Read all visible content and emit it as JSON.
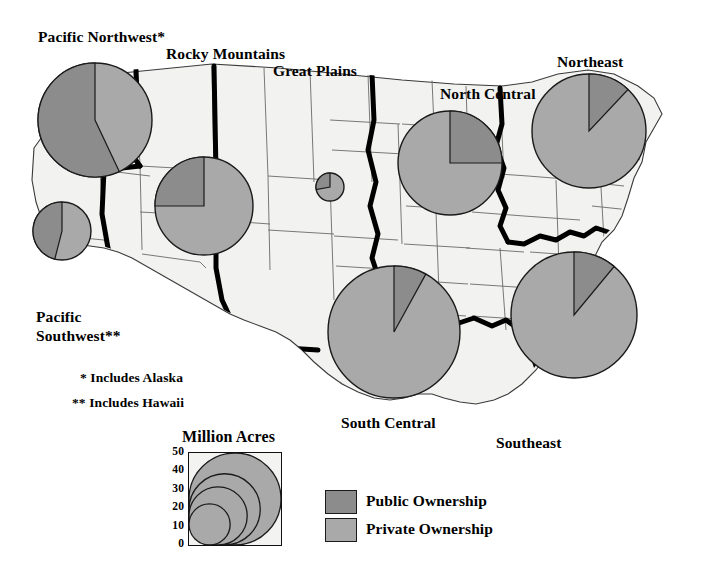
{
  "figure": {
    "type": "choropleth-pie-map",
    "background_color": "#ffffff",
    "map_fill": "#f2f2f0",
    "state_line_color": "#5a5a5a",
    "region_border_color": "#000000"
  },
  "colors": {
    "public": "#8c8c8c",
    "private": "#a9a9a9",
    "outline": "#1a1a1a",
    "text": "#000000"
  },
  "region_labels": [
    {
      "key": "pacific-northwest",
      "label": "Pacific Northwest*",
      "x": 38,
      "y": 28
    },
    {
      "key": "rocky-mountains",
      "label": "Rocky Mountains",
      "x": 166,
      "y": 45
    },
    {
      "key": "great-plains",
      "label": "Great Plains",
      "x": 273,
      "y": 62
    },
    {
      "key": "north-central",
      "label": "North Central",
      "x": 440,
      "y": 85
    },
    {
      "key": "northeast",
      "label": "Northeast",
      "x": 557,
      "y": 53
    },
    {
      "key": "pacific-southwest",
      "label": "Pacific Southwest**",
      "x": 36,
      "y": 307
    },
    {
      "key": "south-central",
      "label": "South Central",
      "x": 341,
      "y": 414
    },
    {
      "key": "southeast",
      "label": "Southeast",
      "x": 496,
      "y": 434
    }
  ],
  "footnotes": [
    {
      "key": "alaska",
      "text": "* Includes Alaska",
      "x": 80,
      "y": 370
    },
    {
      "key": "hawaii",
      "text": "** Includes Hawaii",
      "x": 72,
      "y": 395
    }
  ],
  "chart_data": {
    "type": "pie",
    "units": "Million Acres",
    "legend": [
      "Public Ownership",
      "Private Ownership"
    ],
    "legend_position": "bottom-right",
    "size_encoding": "circle area proportional to million acres",
    "scale_ticks": [
      0,
      10,
      20,
      30,
      40,
      50
    ],
    "scale_circles": [
      10,
      20,
      30,
      50
    ],
    "pies": [
      {
        "region": "Pacific Northwest*",
        "cx": 95,
        "cy": 120,
        "r": 57,
        "public_pct": 57,
        "private_pct": 43,
        "million_acres": 49,
        "start_angle": 0,
        "direction": "counterclockwise"
      },
      {
        "region": "Rocky Mountains",
        "cx": 204,
        "cy": 206,
        "r": 49,
        "public_pct": 25,
        "private_pct": 75,
        "million_acres": 37,
        "start_angle": 0,
        "direction": "counterclockwise"
      },
      {
        "region": "Great Plains",
        "cx": 330,
        "cy": 187,
        "r": 14,
        "public_pct": 28,
        "private_pct": 72,
        "million_acres": 3,
        "start_angle": 0,
        "direction": "counterclockwise"
      },
      {
        "region": "North Central",
        "cx": 450,
        "cy": 163,
        "r": 52,
        "public_pct": 25,
        "private_pct": 75,
        "million_acres": 40,
        "start_angle": 0,
        "direction": "clockwise"
      },
      {
        "region": "Northeast",
        "cx": 589,
        "cy": 131,
        "r": 57,
        "public_pct": 12,
        "private_pct": 88,
        "million_acres": 49,
        "start_angle": 0,
        "direction": "clockwise"
      },
      {
        "region": "Pacific Southwest**",
        "cx": 62,
        "cy": 231,
        "r": 29,
        "public_pct": 46,
        "private_pct": 54,
        "million_acres": 13,
        "start_angle": 0,
        "direction": "counterclockwise"
      },
      {
        "region": "South Central",
        "cx": 394,
        "cy": 332,
        "r": 66,
        "public_pct": 8,
        "private_pct": 92,
        "million_acres": 66,
        "start_angle": 0,
        "direction": "clockwise"
      },
      {
        "region": "Southeast",
        "cx": 574,
        "cy": 315,
        "r": 63,
        "public_pct": 11,
        "private_pct": 89,
        "million_acres": 60,
        "start_angle": 0,
        "direction": "clockwise"
      }
    ]
  },
  "legend": {
    "scale_title": "Million Acres",
    "scale_title_x": 182,
    "scale_title_y": 428,
    "box": {
      "x": 188,
      "y": 452,
      "w": 92,
      "h": 92
    },
    "axis_labels": [
      "50",
      "40",
      "30",
      "20",
      "10",
      "0"
    ],
    "swatches": [
      {
        "key": "public",
        "label": "Public Ownership",
        "color": "#8c8c8c",
        "x": 325,
        "y": 490,
        "w": 30,
        "h": 22,
        "text_x": 366,
        "text_y": 492
      },
      {
        "key": "private",
        "label": "Private Ownership",
        "color": "#a9a9a9",
        "x": 325,
        "y": 518,
        "w": 30,
        "h": 22,
        "text_x": 366,
        "text_y": 520
      }
    ]
  }
}
